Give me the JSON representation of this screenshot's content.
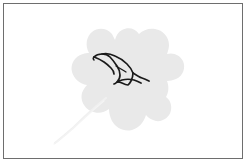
{
  "artwork": {
    "title": "Leaf silhouette with bird line drawing",
    "canvas": {
      "width": 246,
      "height": 162,
      "background_color": "#ffffff"
    },
    "border": {
      "color": "#6e6e6e",
      "width_px": 1,
      "inset_px": 3,
      "style": "solid-rectangle"
    },
    "shapes": [
      {
        "name": "leaf-silhouette",
        "kind": "filled-polygon",
        "fill_color": "#e9e9e9",
        "description": "Five-lobed maple-like leaf, light gray, centered slightly right of middle",
        "bounds": {
          "x": 66,
          "y": 30,
          "width": 116,
          "height": 100
        },
        "path": "M 123 31 C 130 28 138 30 142 36 C 147 32 156 30 163 34 C 170 38 173 46 171 54 C 178 53 184 58 184 65 C 184 72 178 77 171 77 C 172 84 168 91 161 93 C 166 98 166 106 161 111 C 156 116 148 116 143 111 C 140 120 131 126 123 125 C 115 124 109 117 108 109 C 102 114 93 114 87 109 C 81 104 80 95 85 89 C 77 88 71 81 71 73 C 71 65 77 58 85 58 C 82 50 85 41 92 37 C 99 33 108 35 113 41 C 115 36 118 33 123 31 Z"
      },
      {
        "name": "leaf-stem",
        "kind": "stroke-curve",
        "stroke_color": "#f0f0f0",
        "stroke_width": 2,
        "description": "Pale curved stem extending from lower-left of leaf toward bottom-left corner",
        "path": "M 104 100 C 90 110 72 124 56 142"
      },
      {
        "name": "bird-line-drawing",
        "kind": "stroke-outline",
        "stroke_color": "#1a1a1a",
        "stroke_width": 1.6,
        "fill": "none",
        "description": "Black outline of a bird in flight with spread wings, overlaying upper-center of leaf",
        "bounds": {
          "x": 92,
          "y": 50,
          "width": 57,
          "height": 35
        }
      }
    ],
    "palette": {
      "background": "#ffffff",
      "leaf_gray": "#e9e9e9",
      "stem_gray": "#f0f0f0",
      "ink_black": "#1a1a1a",
      "frame_gray": "#6e6e6e"
    }
  }
}
